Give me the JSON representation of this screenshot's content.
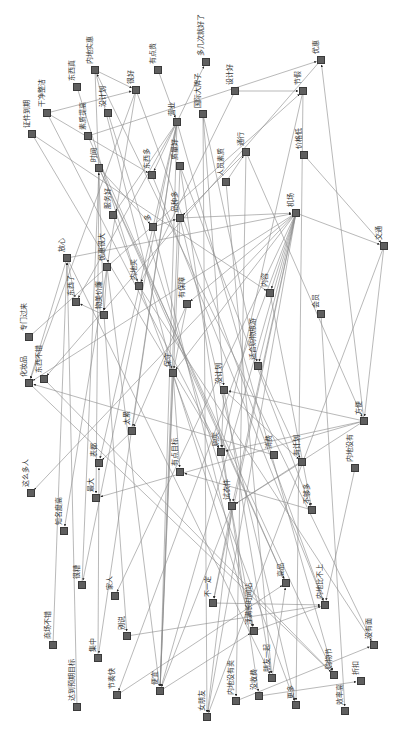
{
  "diagram": {
    "type": "directed-network",
    "orientation": "rotated-90",
    "edge_color": "#8a8a8a",
    "node_color": "#5f5f5f",
    "nodes": [
      {
        "id": "n1",
        "label": "证件到期",
        "x": 32,
        "y": 134,
        "lx": 28,
        "ly": 128
      },
      {
        "id": "n2",
        "label": "干净整洁",
        "x": 47,
        "y": 113,
        "lx": 43,
        "ly": 107
      },
      {
        "id": "n3",
        "label": "东西真",
        "x": 77,
        "y": 87,
        "lx": 73,
        "ly": 81
      },
      {
        "id": "n4",
        "label": "内地实惠",
        "x": 95,
        "y": 70,
        "lx": 91,
        "ly": 64
      },
      {
        "id": "n5",
        "label": "素质提高",
        "x": 88,
        "y": 136,
        "lx": 84,
        "ly": 130
      },
      {
        "id": "n6",
        "label": "没计划",
        "x": 108,
        "y": 113,
        "lx": 104,
        "ly": 107
      },
      {
        "id": "n7",
        "label": "很好",
        "x": 136,
        "y": 90,
        "lx": 132,
        "ly": 84
      },
      {
        "id": "n8",
        "label": "有点贵",
        "x": 158,
        "y": 70,
        "lx": 154,
        "ly": 64
      },
      {
        "id": "n9",
        "label": "多几次就好了",
        "x": 206,
        "y": 62,
        "lx": 202,
        "ly": 56
      },
      {
        "id": "n10",
        "label": "国际大牌子",
        "x": 203,
        "y": 114,
        "lx": 199,
        "ly": 108
      },
      {
        "id": "n11",
        "label": "设计好",
        "x": 235,
        "y": 91,
        "lx": 231,
        "ly": 85
      },
      {
        "id": "n12",
        "label": "优惠",
        "x": 321,
        "y": 60,
        "lx": 317,
        "ly": 54
      },
      {
        "id": "n13",
        "label": "营业",
        "x": 177,
        "y": 122,
        "lx": 173,
        "ly": 116
      },
      {
        "id": "n14",
        "label": "节假",
        "x": 303,
        "y": 91,
        "lx": 299,
        "ly": 85
      },
      {
        "id": "n15",
        "label": "时间",
        "x": 99,
        "y": 168,
        "lx": 95,
        "ly": 162
      },
      {
        "id": "n16",
        "label": "东西多",
        "x": 152,
        "y": 175,
        "lx": 148,
        "ly": 169
      },
      {
        "id": "n17",
        "label": "质量好",
        "x": 180,
        "y": 166,
        "lx": 176,
        "ly": 160
      },
      {
        "id": "n18",
        "label": "人员素质",
        "x": 226,
        "y": 182,
        "lx": 222,
        "ly": 176
      },
      {
        "id": "n19",
        "label": "通行",
        "x": 246,
        "y": 152,
        "lx": 242,
        "ly": 146
      },
      {
        "id": "n20",
        "label": "价格低",
        "x": 304,
        "y": 155,
        "lx": 300,
        "ly": 149
      },
      {
        "id": "n21",
        "label": "放心",
        "x": 67,
        "y": 258,
        "lx": 63,
        "ly": 252
      },
      {
        "id": "n22",
        "label": "服务好",
        "x": 113,
        "y": 215,
        "lx": 109,
        "ly": 209
      },
      {
        "id": "n23",
        "label": "多",
        "x": 153,
        "y": 227,
        "lx": 149,
        "ly": 221
      },
      {
        "id": "n24",
        "label": "品种多",
        "x": 180,
        "y": 218,
        "lx": 176,
        "ly": 212
      },
      {
        "id": "n25",
        "label": "优惠很大",
        "x": 107,
        "y": 267,
        "lx": 103,
        "ly": 261
      },
      {
        "id": "n26",
        "label": "内地买",
        "x": 139,
        "y": 286,
        "lx": 135,
        "ly": 280
      },
      {
        "id": "n27",
        "label": "东西了",
        "x": 76,
        "y": 302,
        "lx": 72,
        "ly": 296
      },
      {
        "id": "n28",
        "label": "物美价廉",
        "x": 104,
        "y": 315,
        "lx": 100,
        "ly": 309
      },
      {
        "id": "n29",
        "label": "专门过来",
        "x": 29,
        "y": 337,
        "lx": 25,
        "ly": 331
      },
      {
        "id": "n30",
        "label": "有保障",
        "x": 187,
        "y": 304,
        "lx": 183,
        "ly": 298
      },
      {
        "id": "n31",
        "label": "机场",
        "x": 296,
        "y": 213,
        "lx": 292,
        "ly": 207
      },
      {
        "id": "n32",
        "label": "交通",
        "x": 384,
        "y": 246,
        "lx": 380,
        "ly": 240
      },
      {
        "id": "n33",
        "label": "内容",
        "x": 270,
        "y": 293,
        "lx": 266,
        "ly": 287
      },
      {
        "id": "n34",
        "label": "会员",
        "x": 321,
        "y": 314,
        "lx": 317,
        "ly": 308
      },
      {
        "id": "n35",
        "label": "适合购物旅游",
        "x": 258,
        "y": 366,
        "lx": 254,
        "ly": 360
      },
      {
        "id": "n36",
        "label": "保守",
        "x": 173,
        "y": 373,
        "lx": 169,
        "ly": 367
      },
      {
        "id": "n37",
        "label": "没计划",
        "x": 224,
        "y": 390,
        "lx": 220,
        "ly": 384
      },
      {
        "id": "n38",
        "label": "化妆品",
        "x": 29,
        "y": 383,
        "lx": 25,
        "ly": 377
      },
      {
        "id": "n39",
        "label": "东西不错",
        "x": 44,
        "y": 379,
        "lx": 40,
        "ly": 373
      },
      {
        "id": "n40",
        "label": "太累",
        "x": 132,
        "y": 431,
        "lx": 128,
        "ly": 425
      },
      {
        "id": "n41",
        "label": "这么多人",
        "x": 31,
        "y": 493,
        "lx": 27,
        "ly": 487
      },
      {
        "id": "n42",
        "label": "表都",
        "x": 99,
        "y": 463,
        "lx": 95,
        "ly": 457
      },
      {
        "id": "n43",
        "label": "有点目标",
        "x": 180,
        "y": 472,
        "lx": 176,
        "ly": 466
      },
      {
        "id": "n44",
        "label": "最大",
        "x": 96,
        "y": 498,
        "lx": 92,
        "ly": 492
      },
      {
        "id": "n45",
        "label": "知名度高",
        "x": 64,
        "y": 531,
        "lx": 60,
        "ly": 525
      },
      {
        "id": "n46",
        "label": "购买",
        "x": 221,
        "y": 452,
        "lx": 217,
        "ly": 446
      },
      {
        "id": "n47",
        "label": "方便",
        "x": 364,
        "y": 421,
        "lx": 360,
        "ly": 415
      },
      {
        "id": "n48",
        "label": "消费",
        "x": 274,
        "y": 455,
        "lx": 270,
        "ly": 449
      },
      {
        "id": "n49",
        "label": "有计划",
        "x": 302,
        "y": 462,
        "lx": 298,
        "ly": 456
      },
      {
        "id": "n50",
        "label": "内地没有",
        "x": 355,
        "y": 468,
        "lx": 351,
        "ly": 462
      },
      {
        "id": "n51",
        "label": "试衣件",
        "x": 232,
        "y": 506,
        "lx": 228,
        "ly": 500
      },
      {
        "id": "n52",
        "label": "不够多",
        "x": 312,
        "y": 510,
        "lx": 308,
        "ly": 504
      },
      {
        "id": "n53",
        "label": "很糟",
        "x": 82,
        "y": 585,
        "lx": 78,
        "ly": 579
      },
      {
        "id": "n54",
        "label": "家人",
        "x": 115,
        "y": 596,
        "lx": 111,
        "ly": 590
      },
      {
        "id": "n55",
        "label": "商场不错",
        "x": 53,
        "y": 645,
        "lx": 49,
        "ly": 639
      },
      {
        "id": "n56",
        "label": "别说",
        "x": 127,
        "y": 636,
        "lx": 123,
        "ly": 630
      },
      {
        "id": "n57",
        "label": "集中",
        "x": 98,
        "y": 658,
        "lx": 94,
        "ly": 652
      },
      {
        "id": "n58",
        "label": "达到预期目标",
        "x": 77,
        "y": 707,
        "lx": 73,
        "ly": 701
      },
      {
        "id": "n59",
        "label": "节奏快",
        "x": 117,
        "y": 695,
        "lx": 113,
        "ly": 689
      },
      {
        "id": "n60",
        "label": "便宜",
        "x": 160,
        "y": 691,
        "lx": 156,
        "ly": 685
      },
      {
        "id": "n61",
        "label": "女朋友",
        "x": 207,
        "y": 717,
        "lx": 203,
        "ly": 711
      },
      {
        "id": "n62",
        "label": "不一定",
        "x": 213,
        "y": 603,
        "lx": 209,
        "ly": 597
      },
      {
        "id": "n63",
        "label": "高品",
        "x": 286,
        "y": 583,
        "lx": 282,
        "ly": 577
      },
      {
        "id": "n64",
        "label": "内地比不上",
        "x": 325,
        "y": 605,
        "lx": 321,
        "ly": 599
      },
      {
        "id": "n65",
        "label": "浮满长时间站",
        "x": 254,
        "y": 631,
        "lx": 250,
        "ly": 625
      },
      {
        "id": "n66",
        "label": "没有面",
        "x": 374,
        "y": 645,
        "lx": 370,
        "ly": 639
      },
      {
        "id": "n67",
        "label": "朋友一起",
        "x": 272,
        "y": 678,
        "lx": 268,
        "ly": 672
      },
      {
        "id": "n68",
        "label": "购物节",
        "x": 334,
        "y": 675,
        "lx": 330,
        "ly": 669
      },
      {
        "id": "n69",
        "label": "折扣",
        "x": 361,
        "y": 681,
        "lx": 357,
        "ly": 675
      },
      {
        "id": "n70",
        "label": "内地没有卖",
        "x": 236,
        "y": 701,
        "lx": 232,
        "ly": 695
      },
      {
        "id": "n71",
        "label": "没收费",
        "x": 259,
        "y": 696,
        "lx": 255,
        "ly": 690
      },
      {
        "id": "n72",
        "label": "更多",
        "x": 296,
        "y": 705,
        "lx": 292,
        "ly": 699
      },
      {
        "id": "n73",
        "label": "效率高",
        "x": 345,
        "y": 711,
        "lx": 341,
        "ly": 705
      }
    ],
    "edges": [
      [
        "n4",
        "n7"
      ],
      [
        "n4",
        "n36"
      ],
      [
        "n4",
        "n28"
      ],
      [
        "n2",
        "n7"
      ],
      [
        "n2",
        "n16"
      ],
      [
        "n2",
        "n46"
      ],
      [
        "n1",
        "n46"
      ],
      [
        "n1",
        "n33"
      ],
      [
        "n6",
        "n51"
      ],
      [
        "n3",
        "n26"
      ],
      [
        "n5",
        "n63"
      ],
      [
        "n5",
        "n12"
      ],
      [
        "n7",
        "n25"
      ],
      [
        "n7",
        "n64"
      ],
      [
        "n8",
        "n13"
      ],
      [
        "n13",
        "n9"
      ],
      [
        "n13",
        "n27"
      ],
      [
        "n13",
        "n16"
      ],
      [
        "n13",
        "n40"
      ],
      [
        "n13",
        "n60"
      ],
      [
        "n13",
        "n53"
      ],
      [
        "n13",
        "n42"
      ],
      [
        "n13",
        "n22"
      ],
      [
        "n13",
        "n57"
      ],
      [
        "n10",
        "n61"
      ],
      [
        "n10",
        "n35"
      ],
      [
        "n10",
        "n37"
      ],
      [
        "n11",
        "n14"
      ],
      [
        "n11",
        "n26"
      ],
      [
        "n12",
        "n39"
      ],
      [
        "n14",
        "n72"
      ],
      [
        "n14",
        "n46"
      ],
      [
        "n15",
        "n23"
      ],
      [
        "n15",
        "n68"
      ],
      [
        "n15",
        "n63"
      ],
      [
        "n15",
        "n44"
      ],
      [
        "n16",
        "n64"
      ],
      [
        "n17",
        "n60"
      ],
      [
        "n17",
        "n71"
      ],
      [
        "n18",
        "n19"
      ],
      [
        "n18",
        "n67"
      ],
      [
        "n19",
        "n24"
      ],
      [
        "n19",
        "n70"
      ],
      [
        "n20",
        "n32"
      ],
      [
        "n21",
        "n67"
      ],
      [
        "n21",
        "n31"
      ],
      [
        "n21",
        "n27"
      ],
      [
        "n21",
        "n38"
      ],
      [
        "n22",
        "n72"
      ],
      [
        "n23",
        "n24"
      ],
      [
        "n23",
        "n65"
      ],
      [
        "n24",
        "n31"
      ],
      [
        "n24",
        "n60"
      ],
      [
        "n25",
        "n28"
      ],
      [
        "n25",
        "n60"
      ],
      [
        "n25",
        "n45"
      ],
      [
        "n26",
        "n66"
      ],
      [
        "n28",
        "n27"
      ],
      [
        "n28",
        "n56"
      ],
      [
        "n29",
        "n14"
      ],
      [
        "n30",
        "n36"
      ],
      [
        "n30",
        "n40"
      ],
      [
        "n31",
        "n32"
      ],
      [
        "n31",
        "n33"
      ],
      [
        "n31",
        "n60"
      ],
      [
        "n31",
        "n61"
      ],
      [
        "n31",
        "n41"
      ],
      [
        "n31",
        "n62"
      ],
      [
        "n31",
        "n36"
      ],
      [
        "n31",
        "n51"
      ],
      [
        "n31",
        "n59"
      ],
      [
        "n31",
        "n54"
      ],
      [
        "n31",
        "n38"
      ],
      [
        "n31",
        "n30"
      ],
      [
        "n32",
        "n47"
      ],
      [
        "n32",
        "n61"
      ],
      [
        "n33",
        "n52"
      ],
      [
        "n34",
        "n73"
      ],
      [
        "n35",
        "n49"
      ],
      [
        "n36",
        "n60"
      ],
      [
        "n36",
        "n43"
      ],
      [
        "n36",
        "n65"
      ],
      [
        "n37",
        "n46"
      ],
      [
        "n37",
        "n49"
      ],
      [
        "n37",
        "n67"
      ],
      [
        "n38",
        "n68"
      ],
      [
        "n39",
        "n68"
      ],
      [
        "n40",
        "n42"
      ],
      [
        "n46",
        "n65"
      ],
      [
        "n47",
        "n46"
      ],
      [
        "n47",
        "n44"
      ],
      [
        "n47",
        "n37"
      ],
      [
        "n47",
        "n51"
      ],
      [
        "n47",
        "n12"
      ],
      [
        "n48",
        "n38"
      ],
      [
        "n49",
        "n51"
      ],
      [
        "n50",
        "n64"
      ],
      [
        "n51",
        "n61"
      ],
      [
        "n51",
        "n60"
      ],
      [
        "n51",
        "n62"
      ],
      [
        "n52",
        "n43"
      ],
      [
        "n55",
        "n21"
      ],
      [
        "n56",
        "n64"
      ],
      [
        "n58",
        "n21"
      ],
      [
        "n59",
        "n63"
      ],
      [
        "n60",
        "n65"
      ],
      [
        "n62",
        "n64"
      ],
      [
        "n65",
        "n64"
      ],
      [
        "n66",
        "n4"
      ],
      [
        "n70",
        "n66"
      ],
      [
        "n71",
        "n69"
      ],
      [
        "n67",
        "n63"
      ],
      [
        "n53",
        "n15"
      ],
      [
        "n57",
        "n42"
      ],
      [
        "n31",
        "n35"
      ],
      [
        "n19",
        "n47"
      ],
      [
        "n24",
        "n72"
      ],
      [
        "n13",
        "n68"
      ],
      [
        "n17",
        "n52"
      ],
      [
        "n7",
        "n38"
      ]
    ]
  }
}
